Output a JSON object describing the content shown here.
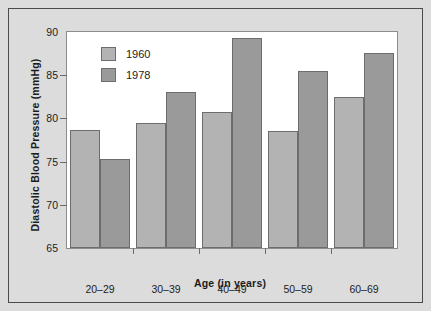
{
  "figure": {
    "background_color": "#dcdcdc",
    "plot_background_color": "#ffffff",
    "frame_color": "#4a4a4a"
  },
  "chart_data": {
    "type": "bar",
    "title": "",
    "xlabel": "Age (in years)",
    "ylabel": "Diastolic Blood Pressure (mmHg)",
    "categories": [
      "20–29",
      "30–39",
      "40–49",
      "50–59",
      "60–69"
    ],
    "series": [
      {
        "name": "1960",
        "color": "#b3b3b3",
        "values": [
          78.7,
          79.5,
          80.7,
          78.6,
          82.5
        ]
      },
      {
        "name": "1978",
        "color": "#9a9a9a",
        "values": [
          75.3,
          83.0,
          89.3,
          85.5,
          87.6
        ]
      }
    ],
    "ylim": [
      65,
      90
    ],
    "yticks": [
      65,
      70,
      75,
      80,
      85,
      90
    ],
    "ytick_labels": [
      "65",
      "70",
      "75",
      "80",
      "85",
      "90"
    ],
    "grid": "single white gridline at y=70",
    "gridline_values": [
      70
    ],
    "legend_position": "upper-left-inside",
    "bar_border_color": "#6d6d6d",
    "axis_color": "#8d8d8d",
    "tick_color": "#6a6a6a"
  }
}
